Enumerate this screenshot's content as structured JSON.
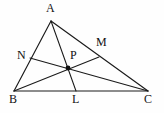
{
  "figure": {
    "kind": "geometry-diagram",
    "background_color": "#fefefe",
    "line_color": "#1a1a1a",
    "label_color": "#111111",
    "width": 164,
    "height": 113
  },
  "points": [
    {
      "id": "A",
      "label": "A",
      "x": 51,
      "y": 21,
      "label_x": 46,
      "label_y": 2,
      "on": "apex-vertex",
      "marked": false
    },
    {
      "id": "B",
      "label": "B",
      "x": 14,
      "y": 91,
      "label_x": 9,
      "label_y": 93,
      "on": "bottom-left-vertex",
      "marked": false
    },
    {
      "id": "C",
      "label": "C",
      "x": 148,
      "y": 91,
      "label_x": 144,
      "label_y": 93,
      "on": "bottom-right-vertex",
      "marked": false
    },
    {
      "id": "N",
      "label": "N",
      "x": 30,
      "y": 58,
      "label_x": 17,
      "label_y": 49,
      "on": "side-AB",
      "marked": false
    },
    {
      "id": "M",
      "label": "M",
      "x": 99,
      "y": 57,
      "label_x": 96,
      "label_y": 36,
      "on": "side-AC",
      "marked": false
    },
    {
      "id": "L",
      "label": "L",
      "x": 76,
      "y": 91,
      "label_x": 72,
      "label_y": 93,
      "on": "side-BC",
      "marked": false
    },
    {
      "id": "P",
      "label": "P",
      "x": 68,
      "y": 68,
      "label_x": 70,
      "label_y": 49,
      "on": "interior-intersection",
      "marked": true
    }
  ],
  "segments": [
    {
      "id": "AB",
      "from": "A",
      "to": "B",
      "role": "triangle-side"
    },
    {
      "id": "AC",
      "from": "A",
      "to": "C",
      "role": "triangle-side"
    },
    {
      "id": "BC",
      "from": "B",
      "to": "C",
      "role": "triangle-side"
    },
    {
      "id": "AL",
      "from": "A",
      "to": "L",
      "role": "cevian"
    },
    {
      "id": "BM",
      "from": "B",
      "to": "M",
      "role": "cevian"
    },
    {
      "id": "CN",
      "from": "C",
      "to": "N",
      "role": "cevian"
    }
  ]
}
